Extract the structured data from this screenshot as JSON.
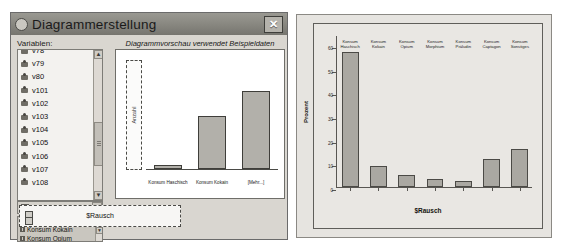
{
  "dialog": {
    "title": "Diagrammerstellung",
    "icon": "chart-window-icon",
    "close_label": "✕",
    "variables_label": "Variablen:",
    "preview_caption": "Diagrammvorschau verwendet Beispieldaten",
    "variables": [
      {
        "label": "v78"
      },
      {
        "label": "v79"
      },
      {
        "label": "v80"
      },
      {
        "label": "v101"
      },
      {
        "label": "v102"
      },
      {
        "label": "v103"
      },
      {
        "label": "v104"
      },
      {
        "label": "v105"
      },
      {
        "label": "v106"
      },
      {
        "label": "v107"
      },
      {
        "label": "v108"
      }
    ],
    "selected_variable": "$Rausch",
    "categories": [
      {
        "label": "Konsum Haschisch"
      },
      {
        "label": "Konsum Kokain"
      },
      {
        "label": "Konsum Opium"
      }
    ],
    "drop_zone_y_label": "Anzahl",
    "legend_label": "$Rausch",
    "scroll_up": "▲",
    "scroll_down": "▼",
    "dropdown_arrow": "▼"
  },
  "chart_data": [
    {
      "type": "bar",
      "title": "",
      "xlabel": "$Rausch",
      "ylabel": "Anzahl",
      "categories": [
        "Konsum Haschisch",
        "Konsum Kokain",
        "[Mehr...]"
      ],
      "values": [
        3,
        42,
        62
      ],
      "ylim": [
        0,
        100
      ],
      "grid": false,
      "legend": "$Rausch",
      "legend_position": "bottom"
    },
    {
      "type": "bar",
      "title": "",
      "xlabel": "$Rausch",
      "ylabel": "Prozent",
      "categories": [
        "Konsum Haschisch",
        "Konsum Kokain",
        "Konsum Opium",
        "Konsum Morphium",
        "Konsum Präludin",
        "Konsum Captagon",
        "Konsum Sonstiges"
      ],
      "values": [
        57,
        9,
        5,
        3.5,
        2.5,
        12,
        16
      ],
      "yticks": [
        0,
        10,
        20,
        30,
        40,
        50,
        60
      ],
      "ytick_labels": [
        "0",
        "10",
        "20",
        "30",
        "40",
        "50",
        "60"
      ],
      "ylim": [
        0,
        65
      ],
      "grid": false,
      "legend": null
    }
  ],
  "colors": {
    "bar_fill": "#aaa8a2",
    "bar_border": "#4b4a46",
    "chart_bg": "#e9e7e3",
    "dialog_bg": "#d9d6d0",
    "titlebar": "#87867f"
  }
}
